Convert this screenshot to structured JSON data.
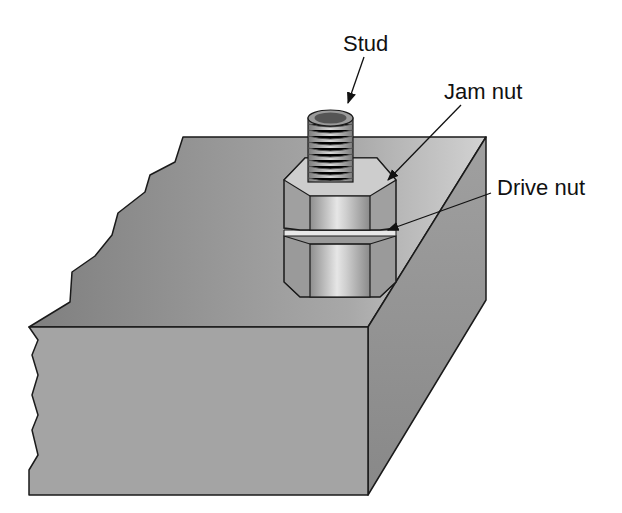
{
  "diagram": {
    "labels": {
      "stud": "Stud",
      "jam_nut": "Jam nut",
      "drive_nut": "Drive nut"
    },
    "colors": {
      "top_face": "#9a9a9a",
      "top_face_light": "#c8c8c8",
      "front_face": "#a6a6a6",
      "right_face": "#8c8c8c",
      "nut": "#bdbdbd",
      "outline": "#1a1a1a",
      "background": "#ffffff"
    }
  }
}
